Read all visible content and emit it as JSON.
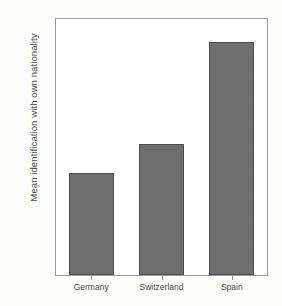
{
  "chart_data": {
    "type": "bar",
    "title": "",
    "subtitle": "",
    "xlabel": "",
    "ylabel": "Mean identification with own nationality",
    "categories": [
      "Germany",
      "Switzerland",
      "Spain"
    ],
    "values": [
      4.0,
      4.22,
      5.02
    ],
    "value_labels": [
      "4,00",
      "4,22",
      "5,02"
    ],
    "ylim": [
      3.2,
      5.2
    ],
    "ytick_values": [
      3.2,
      3.4,
      3.6,
      3.8,
      4.0,
      4.2,
      4.4,
      4.6,
      4.8,
      5.0,
      5.2
    ],
    "ytick_labels": [
      "3,2",
      "3,4",
      "3,6",
      "3,8",
      "4,0",
      "4,2",
      "4,4",
      "4,6",
      "4,8",
      "5,0",
      "5,2"
    ],
    "decimal_separator": ",",
    "grid": false,
    "legend": false,
    "legend_position": "none",
    "series": [
      {
        "name": "Mean identification with own nationality",
        "values": [
          4.0,
          4.22,
          5.02
        ]
      }
    ],
    "colors": {
      "bar_fill": "#6e6e6e",
      "bar_outline": "#4d4d4d",
      "axis": "#9a9a9a",
      "text": "#4a4a4a",
      "plot_background": "#ffffff",
      "page_background": "#fdfdfc"
    }
  }
}
